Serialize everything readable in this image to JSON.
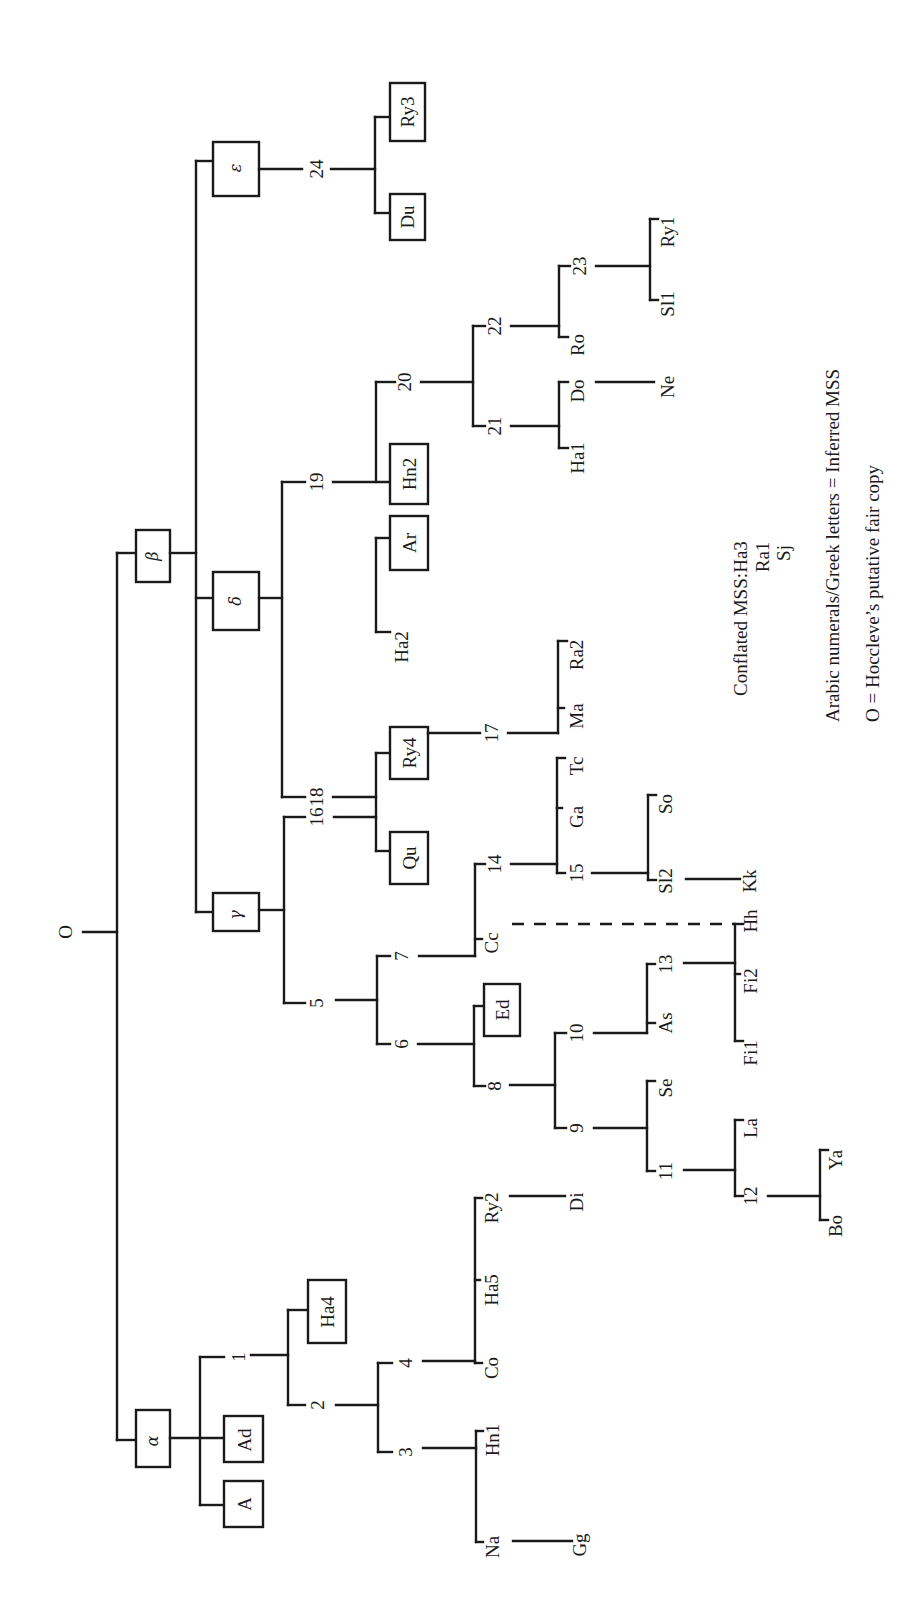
{
  "diagram": {
    "type": "manuscript-stemma",
    "orientation": "rotated-90-counterclockwise",
    "root": "O",
    "hyparchetypes": {
      "alpha": "α",
      "beta": "β",
      "gamma": "γ",
      "delta": "δ",
      "epsilon": "ε"
    },
    "boxed_nodes": [
      "α",
      "β",
      "γ",
      "δ",
      "ε",
      "A",
      "Ad",
      "Ha4",
      "Ed",
      "Qu",
      "Ry4",
      "Ar",
      "Hn2",
      "Du",
      "Ry3"
    ],
    "nodes": {
      "n1": "1",
      "n2": "2",
      "n3": "3",
      "n4": "4",
      "n5": "5",
      "n6": "6",
      "n7": "7",
      "n8": "8",
      "n9": "9",
      "n10": "10",
      "n11": "11",
      "n12": "12",
      "n13": "13",
      "n14": "14",
      "n15": "15",
      "n16": "16",
      "n17": "17",
      "n18": "18",
      "n19": "19",
      "n20": "20",
      "n21": "21",
      "n22": "22",
      "n23": "23",
      "n24": "24"
    },
    "mss": {
      "A": "A",
      "Ad": "Ad",
      "Ha4": "Ha4",
      "Na": "Na",
      "Gg": "Gg",
      "Hn1": "Hn1",
      "Co": "Co",
      "Ha5": "Ha5",
      "Ry2": "Ry2",
      "Di": "Di",
      "Ed": "Ed",
      "Cc": "Cc",
      "Se": "Se",
      "As": "As",
      "La": "La",
      "Bo": "Bo",
      "Ya": "Ya",
      "Fi1": "Fi1",
      "Fi2": "Fi2",
      "Hh": "Hh",
      "Ga": "Ga",
      "Tc": "Tc",
      "Sl2": "Sl2",
      "So": "So",
      "Kk": "Kk",
      "Qu": "Qu",
      "Ry4": "Ry4",
      "Ma": "Ma",
      "Ra2": "Ra2",
      "Ha2": "Ha2",
      "Ar": "Ar",
      "Hn2": "Hn2",
      "Ha1": "Ha1",
      "Do": "Do",
      "Ne": "Ne",
      "Ro": "Ro",
      "Sl1": "Sl1",
      "Ry1": "Ry1",
      "Du": "Du",
      "Ry3": "Ry3"
    },
    "edges": [
      [
        "O",
        "α"
      ],
      [
        "O",
        "β"
      ],
      [
        "α",
        "A"
      ],
      [
        "α",
        "Ad"
      ],
      [
        "α",
        "1"
      ],
      [
        "1",
        "Ha4"
      ],
      [
        "1",
        "2"
      ],
      [
        "2",
        "3"
      ],
      [
        "2",
        "4"
      ],
      [
        "3",
        "Na"
      ],
      [
        "3",
        "Hn1"
      ],
      [
        "Na",
        "Gg"
      ],
      [
        "4",
        "Co"
      ],
      [
        "4",
        "Ha5"
      ],
      [
        "4",
        "Ry2"
      ],
      [
        "Ry2",
        "Di"
      ],
      [
        "β",
        "γ"
      ],
      [
        "β",
        "δ"
      ],
      [
        "β",
        "ε"
      ],
      [
        "γ",
        "5"
      ],
      [
        "γ",
        "16"
      ],
      [
        "5",
        "6"
      ],
      [
        "5",
        "7"
      ],
      [
        "6",
        "8"
      ],
      [
        "6",
        "Ed"
      ],
      [
        "8",
        "9"
      ],
      [
        "8",
        "10"
      ],
      [
        "9",
        "11"
      ],
      [
        "9",
        "Se"
      ],
      [
        "11",
        "12"
      ],
      [
        "11",
        "La"
      ],
      [
        "12",
        "Bo"
      ],
      [
        "12",
        "Ya"
      ],
      [
        "10",
        "As"
      ],
      [
        "10",
        "13"
      ],
      [
        "13",
        "Fi1"
      ],
      [
        "13",
        "Fi2"
      ],
      [
        "13",
        "Hh"
      ],
      [
        "7",
        "Cc"
      ],
      [
        "7",
        "14"
      ],
      [
        "14",
        "15"
      ],
      [
        "14",
        "Ga"
      ],
      [
        "14",
        "Tc"
      ],
      [
        "15",
        "Sl2"
      ],
      [
        "15",
        "So"
      ],
      [
        "Sl2",
        "Kk"
      ],
      [
        "16",
        "Qu"
      ],
      [
        "16",
        "Ry4"
      ],
      [
        "Ry4",
        "17"
      ],
      [
        "17",
        "Ma"
      ],
      [
        "17",
        "Ra2"
      ],
      [
        "δ",
        "18"
      ],
      [
        "δ",
        "19"
      ],
      [
        "18",
        "Ha2"
      ],
      [
        "18",
        "Ar"
      ],
      [
        "19",
        "Hn2"
      ],
      [
        "19",
        "20"
      ],
      [
        "20",
        "21"
      ],
      [
        "20",
        "22"
      ],
      [
        "21",
        "Ha1"
      ],
      [
        "21",
        "Do"
      ],
      [
        "Do",
        "Ne"
      ],
      [
        "22",
        "Ro"
      ],
      [
        "22",
        "23"
      ],
      [
        "23",
        "Sl1"
      ],
      [
        "23",
        "Ry1"
      ],
      [
        "ε",
        "24"
      ],
      [
        "24",
        "Du"
      ],
      [
        "24",
        "Ry3"
      ]
    ],
    "contamination_edges": [
      [
        "Cc",
        "Hh"
      ]
    ]
  },
  "legend": {
    "conflated_label": "Conflated MSS:",
    "conflated_mss": [
      "Ha3",
      "Ra1",
      "Sj"
    ],
    "inferred_note": "Arabic numerals/Greek letters = Inferred MSS",
    "root_note": "O = Hoccleve’s putative fair copy"
  }
}
